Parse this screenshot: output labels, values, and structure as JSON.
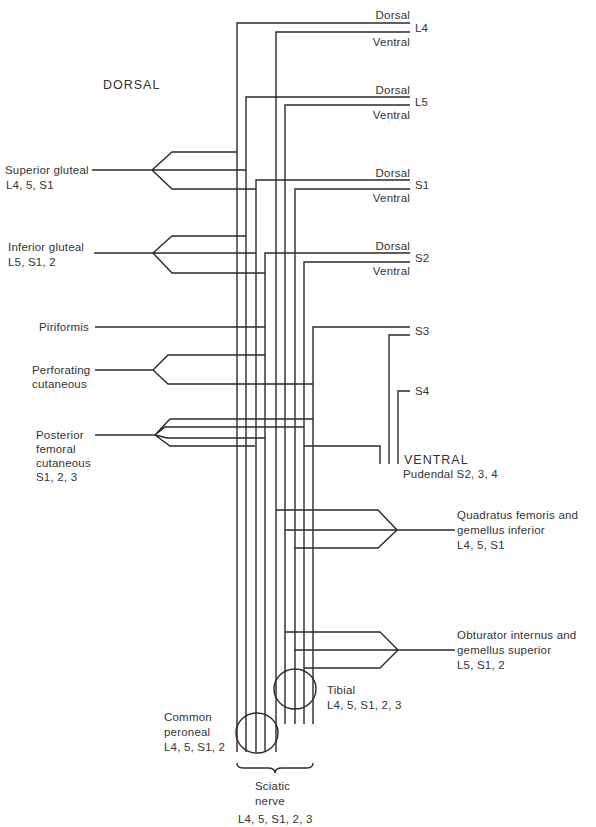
{
  "diagram": {
    "region_dorsal": "DORSAL",
    "region_ventral": "VENTRAL",
    "roots": [
      {
        "name": "L4",
        "upper": "Dorsal",
        "lower": "Ventral"
      },
      {
        "name": "L5",
        "upper": "Dorsal",
        "lower": "Ventral"
      },
      {
        "name": "S1",
        "upper": "Dorsal",
        "lower": "Ventral"
      },
      {
        "name": "S2",
        "upper": "Dorsal",
        "lower": "Ventral"
      },
      {
        "name": "S3"
      },
      {
        "name": "S4"
      }
    ],
    "left_nerves": [
      {
        "name": "Superior gluteal",
        "roots": "L4, 5, S1"
      },
      {
        "name": "Inferior gluteal",
        "roots": "L5, S1, 2"
      },
      {
        "name": "Piriformis"
      },
      {
        "name": "Perforating",
        "name2": "cutaneous"
      },
      {
        "name": "Posterior",
        "name2": "femoral",
        "name3": "cutaneous",
        "roots": "S1, 2, 3"
      }
    ],
    "right_nerves": [
      {
        "name": "Pudendal S2, 3, 4"
      },
      {
        "name": "Quadratus femoris and",
        "name2": "gemellus inferior",
        "roots": "L4, 5, S1"
      },
      {
        "name": "Obturator internus and",
        "name2": "gemellus superior",
        "roots": "L5, S1, 2"
      }
    ],
    "terminal": {
      "tibial": {
        "name": "Tibial",
        "roots": "L4, 5, S1, 2, 3"
      },
      "common_peroneal": {
        "name": "Common",
        "name2": "peroneal",
        "roots": "L4, 5, S1, 2"
      },
      "sciatic": {
        "name": "Sciatic",
        "name2": "nerve",
        "roots": "L4, 5, S1, 2, 3"
      }
    }
  }
}
